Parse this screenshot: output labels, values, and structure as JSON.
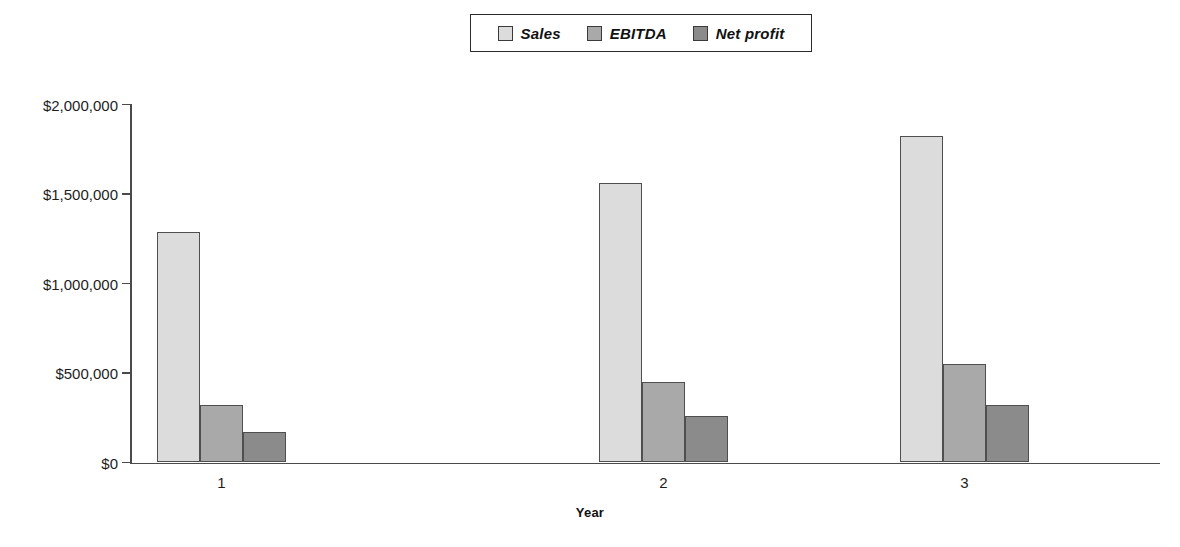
{
  "legend": {
    "position": "top-center",
    "entries": [
      {
        "label": "Sales",
        "color": "#dcdcdc"
      },
      {
        "label": "EBITDA",
        "color": "#a9a9a9"
      },
      {
        "label": "Net profit",
        "color": "#8b8b8b"
      }
    ]
  },
  "axes": {
    "x_title": "Year",
    "x_tick_labels": [
      "1",
      "2",
      "3"
    ],
    "y_tick_labels": [
      "$0",
      "$500,000",
      "$1,000,000",
      "$1,500,000",
      "$2,000,000"
    ]
  },
  "chart_data": {
    "type": "bar",
    "title": "",
    "subtitle": "",
    "xlabel": "Year",
    "ylabel": "",
    "categories": [
      "1",
      "2",
      "3"
    ],
    "series": [
      {
        "name": "Sales",
        "color": "#dcdcdc",
        "values": [
          1290000,
          1560000,
          1825000
        ]
      },
      {
        "name": "EBITDA",
        "color": "#a9a9a9",
        "values": [
          320000,
          450000,
          550000
        ]
      },
      {
        "name": "Net profit",
        "color": "#8b8b8b",
        "values": [
          172000,
          258000,
          320000
        ]
      }
    ],
    "ylim": [
      0,
      2000000
    ],
    "yticks": [
      0,
      500000,
      1000000,
      1500000,
      2000000
    ],
    "ytick_labels": [
      "$0",
      "$500,000",
      "$1,000,000",
      "$1,500,000",
      "$2,000,000"
    ],
    "grid": false,
    "legend": [
      "Sales",
      "EBITDA",
      "Net profit"
    ],
    "legend_position": "top-center",
    "bar_grouping": "grouped-touching"
  },
  "geometry": {
    "plot_left": 130,
    "plot_right": 1160,
    "baseline_y": 462.5,
    "top_y": 104.5,
    "bar_width": 43,
    "group_starts": [
      157,
      599,
      900
    ]
  }
}
